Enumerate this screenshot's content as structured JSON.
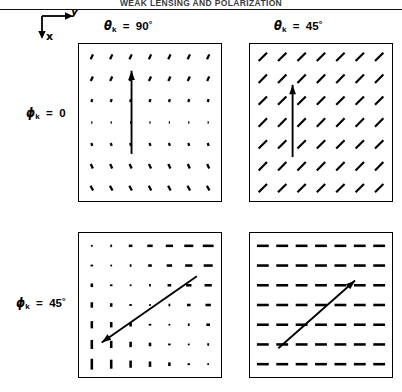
{
  "figure": {
    "running_head": "WEAK LENSING AND POLARIZATION",
    "axis_key": {
      "horizontal_label": "y",
      "vertical_label": "x",
      "name": "coordinate-axes-key"
    },
    "columns": [
      {
        "id": "theta-90",
        "symbol": "θ",
        "subscript": "k",
        "equals": "=",
        "value": "90",
        "degree": "°",
        "label": "θk = 90°"
      },
      {
        "id": "theta-45",
        "symbol": "θ",
        "subscript": "k",
        "equals": "=",
        "value": "45",
        "degree": "°",
        "label": "θk = 45°"
      }
    ],
    "rows": [
      {
        "id": "phi-0",
        "symbol": "ϕ",
        "subscript": "k",
        "equals": "=",
        "value": "0",
        "degree": "",
        "label": "ϕk = 0"
      },
      {
        "id": "phi-45",
        "symbol": "ϕ",
        "subscript": "k",
        "equals": "=",
        "value": "45",
        "degree": "°",
        "label": "ϕk = 45°"
      }
    ]
  },
  "chart_data": {
    "type": "quiver",
    "title": "WEAK LENSING AND POLARIZATION",
    "xlabel": "y",
    "ylabel": "x",
    "grid": false,
    "legend": null,
    "grid_n": 7,
    "panels": [
      {
        "id": "panel-theta90-phi0",
        "row": 0,
        "col": 0,
        "theta_k": 90,
        "phi_k": 0,
        "tick_pattern": "row-dependent tilt: sticks lean left-down at top rows, shrink to points in the central row, lean right-down at bottom rows",
        "tick_angles_by_row_deg": [
          -65,
          -65,
          -70,
          0,
          70,
          65,
          62
        ],
        "tick_lengths_by_row": [
          5.5,
          5.0,
          3.0,
          1.2,
          3.0,
          5.0,
          5.5
        ],
        "arrow": {
          "name": "wavevector-arrow",
          "x1": 0.37,
          "y1": 0.7,
          "x2": 0.37,
          "y2": 0.17,
          "direction": "up",
          "label": "k"
        }
      },
      {
        "id": "panel-theta45-phi0",
        "row": 0,
        "col": 1,
        "theta_k": 45,
        "phi_k": 0,
        "tick_pattern": "uniform 45-degree sticks running from upper-left to lower-right across the whole field",
        "tick_angles_by_row_deg": [
          -45,
          -45,
          -45,
          -45,
          -45,
          -45,
          -45
        ],
        "tick_lengths_by_row": [
          11,
          11,
          11,
          11,
          11,
          11,
          11
        ],
        "arrow": {
          "name": "wavevector-arrow",
          "x1": 0.3,
          "y1": 0.72,
          "x2": 0.3,
          "y2": 0.26,
          "direction": "up",
          "label": "k"
        }
      },
      {
        "id": "panel-theta90-phi45",
        "row": 1,
        "col": 0,
        "theta_k": 90,
        "phi_k": 45,
        "tick_pattern": "orientation rotates across the diagonal: vertical sticks at lower-left, vanishing to points along the anti-diagonal, horizontal sticks at upper-right",
        "arrow": {
          "name": "wavevector-arrow",
          "x1": 0.83,
          "y1": 0.3,
          "x2": 0.16,
          "y2": 0.76,
          "direction": "down-left",
          "label": "k"
        }
      },
      {
        "id": "panel-theta45-phi45",
        "row": 1,
        "col": 1,
        "theta_k": 45,
        "phi_k": 45,
        "tick_pattern": "uniform horizontal sticks across the whole field",
        "tick_angles_by_row_deg": [
          0,
          0,
          0,
          0,
          0,
          0,
          0
        ],
        "tick_lengths_by_row": [
          11,
          11,
          11,
          11,
          11,
          11,
          11
        ],
        "arrow": {
          "name": "wavevector-arrow",
          "x1": 0.2,
          "y1": 0.8,
          "x2": 0.74,
          "y2": 0.33,
          "direction": "up-right",
          "label": "k"
        }
      }
    ]
  }
}
